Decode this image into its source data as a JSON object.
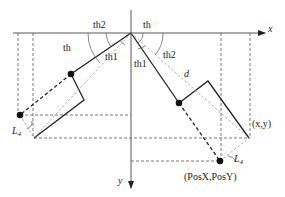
{
  "diagram": {
    "axes": {
      "x_label": "x",
      "y_label": "y"
    },
    "angle_labels": {
      "left_th2": "th2",
      "left_th": "th",
      "left_th1": "th1",
      "top_th": "th",
      "right_th1": "th1",
      "right_th2": "th2"
    },
    "distance_label": "d",
    "link_labels": {
      "left_L4": "L",
      "left_L4_sub": "4",
      "right_L4": "L",
      "right_L4_sub": "4"
    },
    "point_labels": {
      "end_effector": "(x,y)",
      "target": "(PosX,PosY)"
    },
    "colors": {
      "line": "#222222",
      "dash": "#555555",
      "background": "#ffffff"
    }
  }
}
